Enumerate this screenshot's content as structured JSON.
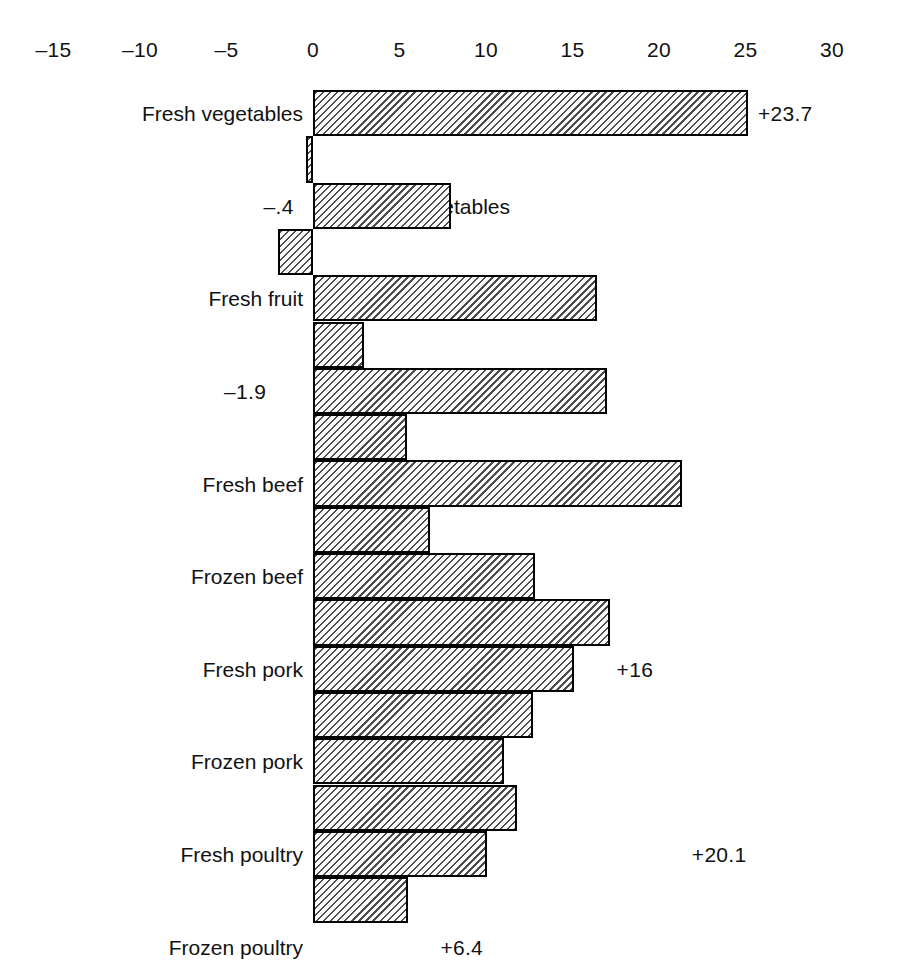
{
  "chart_data": {
    "type": "bar",
    "orientation": "horizontal",
    "title": "",
    "subtitle": "",
    "xlabel": "",
    "ylabel": "",
    "xlim": [
      -15,
      30
    ],
    "grid": false,
    "legend": null,
    "tick_labels": [
      "–15",
      "–10",
      "–5",
      "0",
      "5",
      "10",
      "15",
      "20",
      "25",
      "30"
    ],
    "tick_values": [
      -15,
      -10,
      -5,
      0,
      5,
      10,
      15,
      20,
      25,
      30
    ],
    "categories": [
      "Fresh vegetables",
      "Canned vegetables",
      "Fresh fruit",
      "Canned fruit",
      "Fresh beef",
      "Frozen beef",
      "Fresh pork",
      "Frozen pork",
      "Fresh poultry",
      "Frozen poultry",
      "Fresh seafood",
      "Frozen seafood",
      "Coffee",
      "Tea",
      "Juices",
      "Fats and oils",
      "Fresh baked goods",
      "Frozen baked goods"
    ],
    "values": [
      23.7,
      -0.4,
      7.5,
      -1.9,
      15.5,
      2.8,
      16,
      5.1,
      20.1,
      6.4,
      12.1,
      16.2,
      14.2,
      12,
      10.4,
      11.1,
      9.5,
      5.2
    ],
    "value_labels": [
      "+23.7",
      "–.4",
      "+7.5",
      "–1.9",
      "+15.5",
      "+2.8",
      "+16",
      "+5.1",
      "+20.1",
      "+6.4",
      "+12.1",
      "+16.2",
      "+14.2",
      "+12",
      "+10.4",
      "+11.1",
      "+9.5",
      "+5.2"
    ],
    "bar_fill": "#c9c9c9",
    "bar_edge": "#000000",
    "bar_pattern": "diagonal-hatch",
    "background": "#ffffff"
  },
  "rows": [
    {
      "label": "Fresh vegetables",
      "value": 23.7,
      "value_label": "+23.7",
      "label_placement": "outside"
    },
    {
      "label": "Canned vegetables",
      "value": -0.4,
      "value_label": "–.4",
      "label_placement": "inside"
    },
    {
      "label": "Fresh fruit",
      "value": 7.5,
      "value_label": "+7.5",
      "label_placement": "outside"
    },
    {
      "label": "Canned fruit",
      "value": -1.9,
      "value_label": "–1.9",
      "label_placement": "inside"
    },
    {
      "label": "Fresh beef",
      "value": 15.5,
      "value_label": "+15.5",
      "label_placement": "outside"
    },
    {
      "label": "Frozen beef",
      "value": 2.8,
      "value_label": "+2.8",
      "label_placement": "outside"
    },
    {
      "label": "Fresh pork",
      "value": 16,
      "value_label": "+16",
      "label_placement": "outside"
    },
    {
      "label": "Frozen pork",
      "value": 5.1,
      "value_label": "+5.1",
      "label_placement": "outside"
    },
    {
      "label": "Fresh poultry",
      "value": 20.1,
      "value_label": "+20.1",
      "label_placement": "outside"
    },
    {
      "label": "Frozen poultry",
      "value": 6.4,
      "value_label": "+6.4",
      "label_placement": "outside"
    },
    {
      "label": "Fresh seafood",
      "value": 12.1,
      "value_label": "+12.1",
      "label_placement": "outside"
    },
    {
      "label": "Frozen seafood",
      "value": 16.2,
      "value_label": "+16.2",
      "label_placement": "outside"
    },
    {
      "label": "Coffee",
      "value": 14.2,
      "value_label": "+14.2",
      "label_placement": "outside"
    },
    {
      "label": "Tea",
      "value": 12,
      "value_label": "+12",
      "label_placement": "outside"
    },
    {
      "label": "Juices",
      "value": 10.4,
      "value_label": "+10.4",
      "label_placement": "outside"
    },
    {
      "label": "Fats and oils",
      "value": 11.1,
      "value_label": "+11.1",
      "label_placement": "outside"
    },
    {
      "label": "Fresh baked goods",
      "value": 9.5,
      "value_label": "+9.5",
      "label_placement": "outside"
    },
    {
      "label": "Frozen baked goods",
      "value": 5.2,
      "value_label": "+5.2",
      "label_placement": "outside"
    }
  ],
  "geometry": {
    "zero_x": 313,
    "px_per_unit_bars": 18.35,
    "px_per_unit_axis": 17.3,
    "axis_top": 38,
    "plot_top": 90,
    "row_height": 46.3,
    "bar_height": 46.3
  }
}
